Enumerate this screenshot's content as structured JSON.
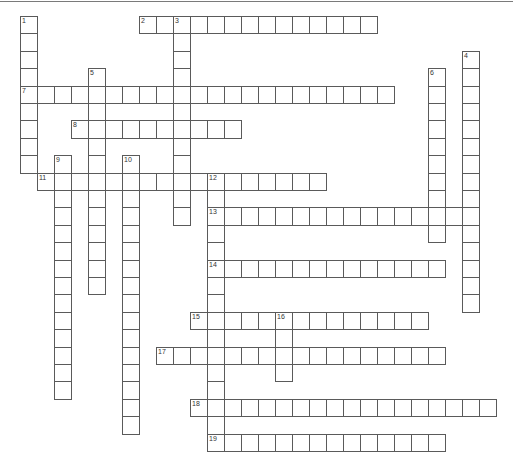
{
  "puzzle": {
    "type": "crossword",
    "grid": {
      "cell_w": 17,
      "cell_h": 17.4,
      "origin_x": 20,
      "origin_y": 16
    },
    "entries": [
      {
        "number": "1",
        "direction": "down",
        "row": 0,
        "col": 0,
        "length": 9
      },
      {
        "number": "2",
        "direction": "across",
        "row": 0,
        "col": 7,
        "length": 14
      },
      {
        "number": "3",
        "direction": "down",
        "row": 0,
        "col": 9,
        "length": 12
      },
      {
        "number": "4",
        "direction": "down",
        "row": 2,
        "col": 26,
        "length": 15
      },
      {
        "number": "5",
        "direction": "down",
        "row": 3,
        "col": 4,
        "length": 13
      },
      {
        "number": "6",
        "direction": "down",
        "row": 3,
        "col": 24,
        "length": 10
      },
      {
        "number": "7",
        "direction": "across",
        "row": 4,
        "col": 0,
        "length": 22
      },
      {
        "number": "8",
        "direction": "across",
        "row": 6,
        "col": 3,
        "length": 10
      },
      {
        "number": "9",
        "direction": "down",
        "row": 8,
        "col": 2,
        "length": 14
      },
      {
        "number": "10",
        "direction": "down",
        "row": 8,
        "col": 6,
        "length": 16
      },
      {
        "number": "11",
        "direction": "across",
        "row": 9,
        "col": 1,
        "length": 17
      },
      {
        "number": "12",
        "direction": "down",
        "row": 9,
        "col": 11,
        "length": 16
      },
      {
        "number": "13",
        "direction": "across",
        "row": 11,
        "col": 11,
        "length": 16
      },
      {
        "number": "14",
        "direction": "across",
        "row": 14,
        "col": 11,
        "length": 14
      },
      {
        "number": "15",
        "direction": "across",
        "row": 17,
        "col": 10,
        "length": 14
      },
      {
        "number": "16",
        "direction": "down",
        "row": 17,
        "col": 15,
        "length": 4
      },
      {
        "number": "17",
        "direction": "across",
        "row": 19,
        "col": 8,
        "length": 17
      },
      {
        "number": "18",
        "direction": "across",
        "row": 22,
        "col": 10,
        "length": 18
      },
      {
        "number": "19",
        "direction": "across",
        "row": 24,
        "col": 11,
        "length": 14
      }
    ]
  },
  "colors": {
    "border": "#5a5a5a",
    "background": "#ffffff",
    "number": "#333333",
    "top_rule": "#7a7a7a"
  }
}
